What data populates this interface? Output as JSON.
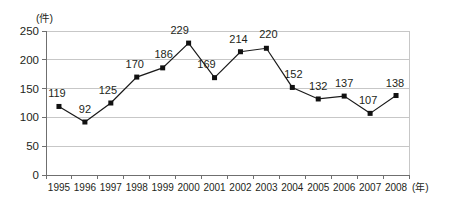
{
  "chart_data": {
    "type": "line",
    "title": "",
    "subtitle": "",
    "xlabel": "(年)",
    "ylabel": "(件)",
    "categories": [
      "1995",
      "1996",
      "1997",
      "1998",
      "1999",
      "2000",
      "2001",
      "2002",
      "2003",
      "2004",
      "2005",
      "2006",
      "2007",
      "2008"
    ],
    "values": [
      119,
      92,
      125,
      170,
      186,
      229,
      169,
      214,
      220,
      152,
      132,
      137,
      107,
      138
    ],
    "series": [
      {
        "name": "件数",
        "values": [
          119,
          92,
          125,
          170,
          186,
          229,
          169,
          214,
          220,
          152,
          132,
          137,
          107,
          138
        ]
      }
    ],
    "data_labels": [
      "119",
      "92",
      "125",
      "170",
      "186",
      "229",
      "169",
      "214",
      "220",
      "152",
      "132",
      "137",
      "107",
      "138"
    ],
    "label_offsets": [
      {
        "dx": -2,
        "dy": -9
      },
      {
        "dx": 0,
        "dy": -9
      },
      {
        "dx": -3,
        "dy": -9
      },
      {
        "dx": -2,
        "dy": -9
      },
      {
        "dx": 1,
        "dy": -10
      },
      {
        "dx": -9,
        "dy": -9
      },
      {
        "dx": -8,
        "dy": -10
      },
      {
        "dx": -2,
        "dy": -9
      },
      {
        "dx": 2,
        "dy": -10
      },
      {
        "dx": 1,
        "dy": -9
      },
      {
        "dx": 0,
        "dy": -9
      },
      {
        "dx": 0,
        "dy": -9
      },
      {
        "dx": -2,
        "dy": -9
      },
      {
        "dx": -1,
        "dy": -9
      }
    ],
    "ylim": [
      0,
      250
    ],
    "yticks": [
      0,
      50,
      100,
      150,
      200,
      250
    ],
    "ytick_labels": [
      "0",
      "50",
      "100",
      "150",
      "200",
      "250"
    ],
    "xtick_labels": [
      "1995",
      "1996",
      "1997",
      "1998",
      "1999",
      "2000",
      "2001",
      "2002",
      "2003",
      "2004",
      "2005",
      "2006",
      "2007",
      "2008"
    ],
    "grid": true,
    "grid_orientation": "horizontal",
    "legend": false,
    "legend_position": "none",
    "marker_style": "filled-square",
    "line_color": "#1a1a1a",
    "marker_color": "#111111",
    "grid_color": "#b9b9b9",
    "axis_color": "#6f6f6f",
    "background_color": "#ffffff"
  }
}
